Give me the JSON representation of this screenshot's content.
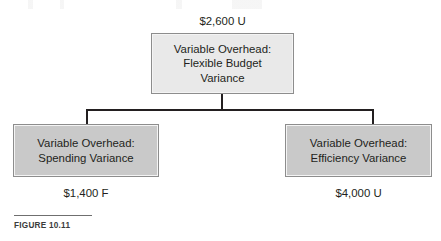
{
  "figure": {
    "caption": "FIGURE 10.11",
    "colors": {
      "root_box_fill": "#e9e9e9",
      "child_box_fill": "#c9c9c9",
      "box_border": "#8d8d8d",
      "connector": "#231f20",
      "text": "#231f20",
      "background": "#ffffff"
    }
  },
  "diagram_data": {
    "type": "tree",
    "root": {
      "id": "variable-overhead-flexible-budget-variance",
      "lines": [
        "Variable Overhead:",
        "Flexible Budget",
        "Variance"
      ],
      "amount": "$2,600 U",
      "amount_position": "above"
    },
    "children": [
      {
        "id": "variable-overhead-spending-variance",
        "lines": [
          "Variable Overhead:",
          "Spending Variance"
        ],
        "amount": "$1,400 F",
        "amount_position": "below"
      },
      {
        "id": "variable-overhead-efficiency-variance",
        "lines": [
          "Variable Overhead:",
          "Efficiency Variance"
        ],
        "amount": "$4,000 U",
        "amount_position": "below"
      }
    ]
  }
}
